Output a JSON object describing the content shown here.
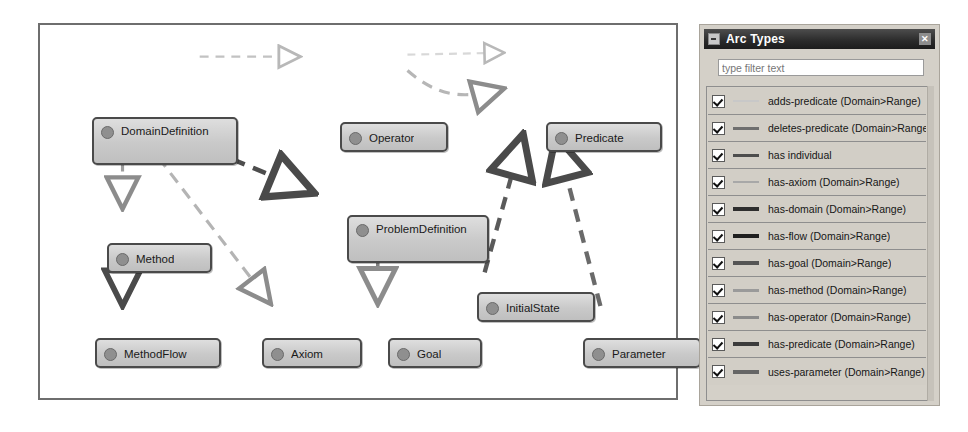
{
  "graph": {
    "nodes": [
      {
        "id": "domain-definition",
        "label": "DomainDefinition",
        "x": 52,
        "y": 92,
        "w": 146,
        "h": 48
      },
      {
        "id": "operator",
        "label": "Operator",
        "x": 300,
        "y": 97,
        "w": 108,
        "h": 30
      },
      {
        "id": "predicate",
        "label": "Predicate",
        "x": 506,
        "y": 97,
        "w": 116,
        "h": 30
      },
      {
        "id": "problem-definition",
        "label": "ProblemDefinition",
        "x": 307,
        "y": 190,
        "w": 142,
        "h": 48
      },
      {
        "id": "method",
        "label": "Method",
        "x": 67,
        "y": 218,
        "w": 105,
        "h": 30
      },
      {
        "id": "initial-state",
        "label": "InitialState",
        "x": 437,
        "y": 267,
        "w": 118,
        "h": 30
      },
      {
        "id": "method-flow",
        "label": "MethodFlow",
        "x": 55,
        "y": 313,
        "w": 126,
        "h": 30
      },
      {
        "id": "axiom",
        "label": "Axiom",
        "x": 222,
        "y": 313,
        "w": 100,
        "h": 30
      },
      {
        "id": "goal",
        "label": "Goal",
        "x": 348,
        "y": 313,
        "w": 94,
        "h": 30
      },
      {
        "id": "parameter",
        "label": "Parameter",
        "x": 543,
        "y": 313,
        "w": 118,
        "h": 30
      }
    ],
    "edges": [
      {
        "id": "domain-to-operator",
        "from": "DomainDefinition",
        "to": "Operator",
        "relation": "has-operator (Domain>Range)"
      },
      {
        "id": "operator-to-predicate",
        "from": "Operator",
        "to": "Predicate",
        "relation": "adds-predicate (Domain>Range)"
      },
      {
        "id": "domain-to-problem",
        "from": "DomainDefinition",
        "to": "ProblemDefinition",
        "relation": "has-domain (Domain>Range)"
      },
      {
        "id": "domain-to-method",
        "from": "DomainDefinition",
        "to": "Method",
        "relation": "has-method (Domain>Range)"
      },
      {
        "id": "domain-to-axiom",
        "from": "DomainDefinition",
        "to": "Axiom",
        "relation": "has-axiom (Domain>Range)"
      },
      {
        "id": "method-to-methodflow",
        "from": "Method",
        "to": "MethodFlow",
        "relation": "has-flow (Domain>Range)"
      },
      {
        "id": "problem-to-goal",
        "from": "ProblemDefinition",
        "to": "Goal",
        "relation": "has-goal (Domain>Range)"
      },
      {
        "id": "predicate-to-initialstate",
        "from": "Predicate",
        "to": "InitialState",
        "relation": "has-predicate (Domain>Range)"
      },
      {
        "id": "predicate-to-parameter",
        "from": "Predicate",
        "to": "Parameter",
        "relation": "uses-parameter (Domain>Range)"
      }
    ]
  },
  "arc_types_view": {
    "title": "Arc Types",
    "menu_icon": "view-menu-icon",
    "close_icon": "close-icon",
    "filter": {
      "placeholder": "type filter text",
      "value": ""
    },
    "items": [
      {
        "label": "adds-predicate (Domain>Range)",
        "checked": true,
        "color": "#c8c8c8",
        "thickness": 2
      },
      {
        "label": "deletes-predicate (Domain>Range)",
        "checked": true,
        "color": "#6f6f6f",
        "thickness": 3
      },
      {
        "label": "has individual",
        "checked": true,
        "color": "#4d4d4d",
        "thickness": 3
      },
      {
        "label": "has-axiom (Domain>Range)",
        "checked": true,
        "color": "#a8a8a8",
        "thickness": 2
      },
      {
        "label": "has-domain (Domain>Range)",
        "checked": true,
        "color": "#2e2e2e",
        "thickness": 4
      },
      {
        "label": "has-flow (Domain>Range)",
        "checked": true,
        "color": "#1f1f1f",
        "thickness": 4
      },
      {
        "label": "has-goal (Domain>Range)",
        "checked": true,
        "color": "#555555",
        "thickness": 4
      },
      {
        "label": "has-method (Domain>Range)",
        "checked": true,
        "color": "#9a9a9a",
        "thickness": 3
      },
      {
        "label": "has-operator (Domain>Range)",
        "checked": true,
        "color": "#8b8b8b",
        "thickness": 3
      },
      {
        "label": "has-predicate (Domain>Range)",
        "checked": true,
        "color": "#3c3c3c",
        "thickness": 4
      },
      {
        "label": "uses-parameter (Domain>Range)",
        "checked": true,
        "color": "#666666",
        "thickness": 4
      }
    ]
  }
}
